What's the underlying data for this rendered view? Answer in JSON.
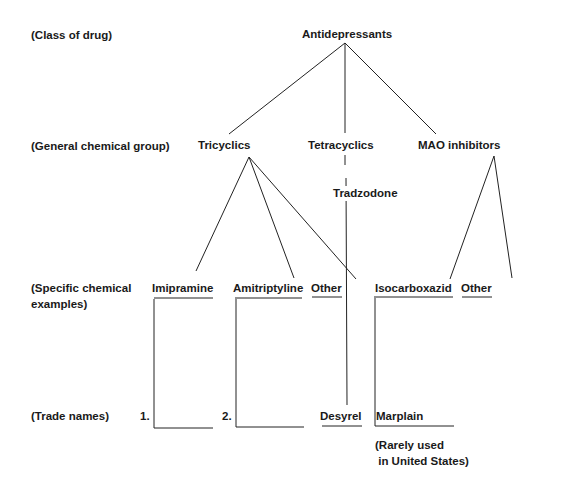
{
  "levels": {
    "class": "(Class of drug)",
    "group": "(General chemical group)",
    "specific_line1": "(Specific chemical",
    "specific_line2": "examples)",
    "trade": "(Trade names)"
  },
  "nodes": {
    "root": "Antidepressants",
    "tricyclics": "Tricyclics",
    "tetracyclics": "Tetracyclics",
    "mao": "MAO inhibitors",
    "tradzodone": "Tradzodone",
    "imipramine": "Imipramine",
    "amitriptyline": "Amitriptyline",
    "tri_other": "Other",
    "isocarboxazid": "Isocarboxazid",
    "mao_other": "Other"
  },
  "trade_names": {
    "imipramine_slot": "1.",
    "amitriptyline_slot": "2.",
    "desyrel": "Desyrel",
    "marplain": "Marplain"
  },
  "note": {
    "line1": "(Rarely used",
    "line2": " in United States)"
  },
  "colors": {
    "ink": "#1a1a1a",
    "background": "#ffffff"
  }
}
